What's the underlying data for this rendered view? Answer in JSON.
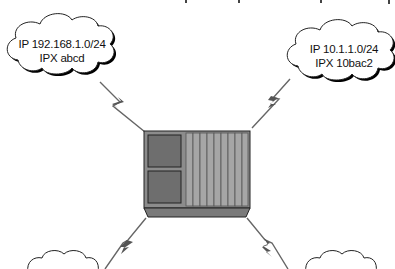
{
  "diagram": {
    "type": "network-topology",
    "clouds": [
      {
        "id": "top-left",
        "line1": "IP 192.168.1.0/24",
        "line2": "IPX abcd"
      },
      {
        "id": "top-right",
        "line1": "IP 10.1.1.0/24",
        "line2": "IPX 10bac2"
      },
      {
        "id": "bottom-left",
        "line1": "",
        "line2": ""
      },
      {
        "id": "bottom-right",
        "line1": "",
        "line2": ""
      }
    ],
    "center_device": {
      "icon": "router-icon",
      "slots": 2,
      "stripes": 9
    },
    "links": [
      {
        "from": "router",
        "to": "top-left",
        "style": "serial-lightning"
      },
      {
        "from": "router",
        "to": "top-right",
        "style": "serial-lightning"
      },
      {
        "from": "router",
        "to": "bottom-left",
        "style": "serial-lightning"
      },
      {
        "from": "router",
        "to": "bottom-right",
        "style": "serial-lightning"
      }
    ],
    "colors": {
      "router_body": "#8c8c8c",
      "router_stripes": "#a6a6a6",
      "router_slot": "#6e6e6e",
      "router_base": "#7a7a7a",
      "outline": "#222222",
      "link": "#666666"
    }
  }
}
